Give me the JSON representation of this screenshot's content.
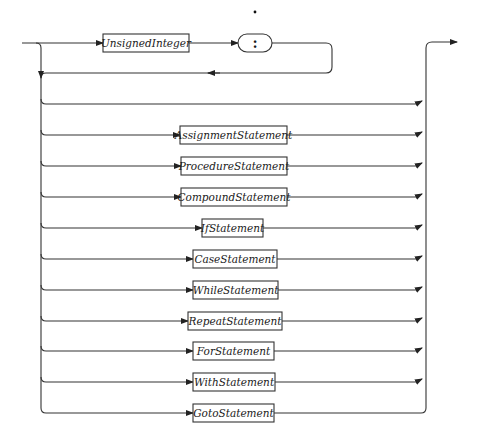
{
  "diagram": {
    "type": "syntax-diagram",
    "stray_mark": ".",
    "label_prefix": {
      "unsigned_integer": "UnsignedInteger",
      "colon": ":"
    },
    "alternatives": [
      {
        "label": "",
        "empty": true
      },
      {
        "label": "AssignmentStatement"
      },
      {
        "label": "ProcedureStatement"
      },
      {
        "label": "CompoundStatement"
      },
      {
        "label": "IfStatement"
      },
      {
        "label": "CaseStatement"
      },
      {
        "label": "WhileStatement"
      },
      {
        "label": "RepeatStatement"
      },
      {
        "label": "ForStatement"
      },
      {
        "label": "WithStatement"
      },
      {
        "label": "GotoStatement"
      }
    ],
    "colors": {
      "line": "#333333",
      "text": "#1a1a1a",
      "background": "#ffffff"
    }
  }
}
